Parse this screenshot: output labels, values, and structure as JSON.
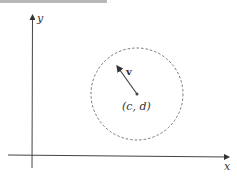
{
  "diagram": {
    "axes": {
      "x_label": "x",
      "y_label": "y"
    },
    "circle": {
      "style": "dashed",
      "center_label": "(c, d)"
    },
    "vector": {
      "label": "v"
    },
    "colors": {
      "axis": "#333333",
      "circle": "#777777",
      "vector": "#444444",
      "topbar": "#b8b8b8"
    }
  }
}
